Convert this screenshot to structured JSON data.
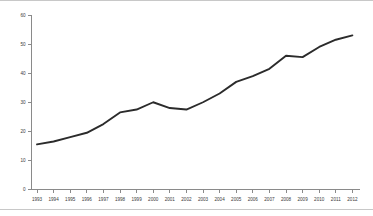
{
  "chart_data": {
    "type": "line",
    "title": "",
    "subtitle": "",
    "xlabel": "",
    "ylabel": "",
    "categories": [
      "1993",
      "1994",
      "1995",
      "1996",
      "1997",
      "1998",
      "1999",
      "2000",
      "2001",
      "2002",
      "2003",
      "2004",
      "2005",
      "2006",
      "2007",
      "2008",
      "2009",
      "2010",
      "2011",
      "2012"
    ],
    "x": [
      1993,
      1994,
      1995,
      1996,
      1997,
      1998,
      1999,
      2000,
      2001,
      2002,
      2003,
      2004,
      2005,
      2006,
      2007,
      2008,
      2009,
      2010,
      2011,
      2012
    ],
    "values": [
      15.5,
      16.5,
      18.0,
      19.5,
      22.5,
      26.5,
      27.5,
      30.0,
      28.0,
      27.5,
      30.0,
      33.0,
      37.0,
      39.0,
      41.5,
      46.0,
      45.5,
      49.0,
      51.5,
      53.0
    ],
    "series": [
      {
        "name": "series-1",
        "color": "#2b2b2b",
        "values": [
          15.5,
          16.5,
          18.0,
          19.5,
          22.5,
          26.5,
          27.5,
          30.0,
          28.0,
          27.5,
          30.0,
          33.0,
          37.0,
          39.0,
          41.5,
          46.0,
          45.5,
          49.0,
          51.5,
          53.0
        ]
      }
    ],
    "ylim": [
      0,
      60
    ],
    "yticks": [
      0,
      10,
      20,
      30,
      40,
      50,
      60
    ],
    "ytick_labels": [
      "0",
      "10",
      "20",
      "30",
      "40",
      "50",
      "60"
    ],
    "xtick_labels": [
      "1993",
      "1994",
      "1995",
      "1996",
      "1997",
      "1998",
      "1999",
      "2000",
      "2001",
      "2002",
      "2003",
      "2004",
      "2005",
      "2006",
      "2007",
      "2008",
      "2009",
      "2010",
      "2011",
      "2012"
    ],
    "grid": false,
    "legend": false,
    "legend_position": "none",
    "annotations": []
  },
  "figure": {
    "axis_color": "#8a8a8a",
    "frame_color": "#c8c8c8",
    "background": "#ffffff",
    "line_color": "#2b2b2b"
  }
}
